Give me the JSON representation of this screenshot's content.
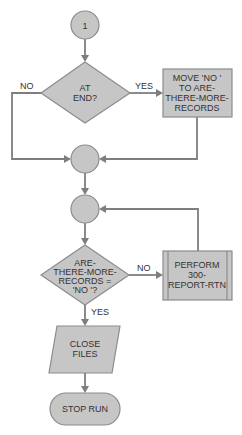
{
  "diagram": {
    "type": "flowchart",
    "colors": {
      "fill": "#c6c6c6",
      "stroke": "#8c8c8c",
      "line": "#7e7e7e",
      "text": "#333333"
    },
    "nodes": {
      "connector1": {
        "shape": "circle",
        "label": "1"
      },
      "decision_at_end": {
        "shape": "diamond",
        "lines": [
          "AT",
          "END?"
        ]
      },
      "move_no": {
        "shape": "process",
        "lines": [
          "MOVE 'NO '",
          "TO ARE-",
          "THERE-MORE-",
          "RECORDS"
        ]
      },
      "connector2": {
        "shape": "circle",
        "label": ""
      },
      "connector3": {
        "shape": "circle",
        "label": ""
      },
      "decision_more_records": {
        "shape": "diamond",
        "lines": [
          "ARE-",
          "THERE-MORE-",
          "RECORDS =",
          "'NO '?"
        ]
      },
      "perform_report": {
        "shape": "predefined-process",
        "lines": [
          "PERFORM",
          "300-",
          "REPORT-RTN"
        ]
      },
      "close_files": {
        "shape": "parallelogram",
        "lines": [
          "CLOSE",
          "FILES"
        ]
      },
      "stop_run": {
        "shape": "terminal",
        "label": "STOP RUN"
      }
    },
    "edge_labels": {
      "at_end_no": "NO",
      "at_end_yes": "YES",
      "more_records_no": "NO",
      "more_records_yes": "YES"
    }
  }
}
